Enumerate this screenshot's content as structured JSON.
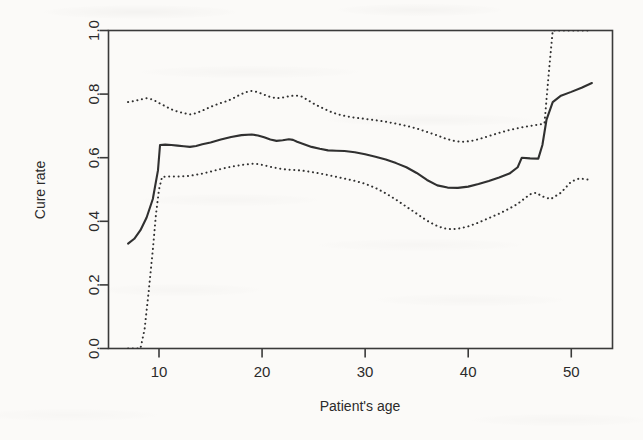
{
  "chart_data": {
    "type": "line",
    "title": "",
    "subtitle": "",
    "xlabel": "Patient's age",
    "ylabel": "Cure rate",
    "xlim": [
      5.1,
      54.0
    ],
    "ylim": [
      0.0,
      1.0
    ],
    "xticks": [
      10,
      20,
      30,
      40,
      50
    ],
    "xtick_labels": [
      "10",
      "20",
      "30",
      "40",
      "50"
    ],
    "yticks": [
      0.0,
      0.2,
      0.4,
      0.6,
      0.8,
      1.0
    ],
    "ytick_labels": [
      "0.0",
      "0.2",
      "0.4",
      "0.6",
      "0.8",
      "1.0"
    ],
    "grid": false,
    "legend": "none",
    "line_color": "#303030",
    "band_color": "#303030",
    "series": [
      {
        "name": "Upper confidence bound",
        "style": "dotted",
        "x": [
          7.0,
          7.6,
          8.2,
          8.8,
          9.4,
          10.0,
          10.6,
          11.2,
          11.8,
          12.4,
          13.0,
          13.6,
          14.2,
          14.8,
          15.4,
          16.0,
          16.6,
          17.2,
          17.8,
          18.4,
          19.0,
          19.6,
          20.2,
          20.8,
          21.4,
          22.0,
          22.6,
          23.2,
          23.8,
          24.4,
          25.0,
          25.8,
          26.6,
          27.4,
          28.2,
          29.0,
          30.0,
          31.0,
          32.0,
          33.0,
          34.0,
          35.0,
          36.0,
          37.0,
          37.8,
          38.6,
          39.4,
          40.2,
          41.0,
          42.0,
          43.0,
          44.0,
          45.0,
          46.0,
          47.0,
          47.4,
          47.8,
          48.2,
          49.0,
          50.0,
          51.0,
          52.0
        ],
        "y": [
          0.775,
          0.778,
          0.783,
          0.787,
          0.783,
          0.772,
          0.762,
          0.752,
          0.745,
          0.74,
          0.736,
          0.74,
          0.748,
          0.757,
          0.765,
          0.772,
          0.778,
          0.787,
          0.797,
          0.806,
          0.81,
          0.806,
          0.798,
          0.791,
          0.787,
          0.789,
          0.793,
          0.796,
          0.793,
          0.782,
          0.77,
          0.757,
          0.745,
          0.736,
          0.73,
          0.726,
          0.722,
          0.718,
          0.713,
          0.707,
          0.7,
          0.692,
          0.681,
          0.67,
          0.66,
          0.653,
          0.65,
          0.652,
          0.658,
          0.668,
          0.678,
          0.687,
          0.694,
          0.7,
          0.705,
          0.708,
          0.86,
          1.0,
          1.0,
          1.0,
          1.0,
          1.0
        ]
      },
      {
        "name": "Estimated cure rate",
        "style": "solid",
        "x": [
          7.0,
          7.6,
          8.2,
          8.8,
          9.4,
          9.9,
          10.1,
          10.6,
          11.2,
          11.8,
          12.4,
          13.0,
          13.6,
          14.2,
          15.0,
          16.0,
          17.0,
          18.0,
          19.0,
          19.6,
          20.2,
          20.8,
          21.4,
          22.0,
          22.6,
          23.0,
          23.4,
          24.0,
          24.8,
          25.6,
          26.4,
          27.2,
          28.0,
          29.0,
          30.0,
          31.0,
          32.0,
          33.0,
          34.0,
          35.0,
          36.0,
          37.0,
          38.0,
          39.0,
          40.0,
          41.0,
          42.0,
          43.0,
          44.0,
          44.8,
          45.2,
          46.0,
          46.8,
          47.2,
          47.6,
          48.2,
          49.0,
          50.0,
          51.0,
          52.0
        ],
        "y": [
          0.33,
          0.345,
          0.372,
          0.412,
          0.47,
          0.56,
          0.64,
          0.641,
          0.64,
          0.638,
          0.636,
          0.634,
          0.637,
          0.642,
          0.648,
          0.657,
          0.665,
          0.671,
          0.673,
          0.67,
          0.664,
          0.657,
          0.653,
          0.655,
          0.658,
          0.656,
          0.65,
          0.643,
          0.634,
          0.628,
          0.623,
          0.622,
          0.621,
          0.617,
          0.611,
          0.603,
          0.594,
          0.583,
          0.57,
          0.552,
          0.53,
          0.513,
          0.506,
          0.505,
          0.509,
          0.517,
          0.527,
          0.538,
          0.55,
          0.57,
          0.6,
          0.598,
          0.597,
          0.64,
          0.72,
          0.775,
          0.795,
          0.807,
          0.82,
          0.835
        ]
      },
      {
        "name": "Lower confidence bound",
        "style": "dotted",
        "x": [
          7.0,
          7.6,
          8.2,
          8.6,
          9.0,
          9.4,
          9.7,
          10.0,
          10.3,
          11.0,
          11.8,
          12.6,
          13.4,
          14.2,
          15.0,
          15.8,
          16.6,
          17.4,
          18.2,
          19.0,
          19.6,
          20.2,
          21.0,
          21.8,
          22.6,
          23.4,
          24.2,
          25.0,
          26.0,
          27.0,
          28.0,
          29.0,
          30.0,
          31.0,
          32.0,
          33.0,
          34.0,
          35.0,
          36.0,
          36.8,
          37.6,
          38.4,
          39.2,
          40.0,
          41.0,
          42.0,
          43.0,
          44.0,
          44.8,
          45.4,
          46.0,
          46.6,
          47.2,
          48.0,
          49.0,
          50.0,
          50.8,
          51.4,
          52.0
        ],
        "y": [
          0.0,
          0.0,
          0.0,
          0.06,
          0.18,
          0.31,
          0.42,
          0.5,
          0.54,
          0.541,
          0.541,
          0.542,
          0.545,
          0.55,
          0.556,
          0.563,
          0.569,
          0.574,
          0.578,
          0.581,
          0.58,
          0.576,
          0.57,
          0.565,
          0.562,
          0.561,
          0.558,
          0.554,
          0.548,
          0.541,
          0.534,
          0.527,
          0.518,
          0.505,
          0.488,
          0.468,
          0.446,
          0.424,
          0.402,
          0.388,
          0.378,
          0.375,
          0.378,
          0.384,
          0.396,
          0.41,
          0.424,
          0.44,
          0.455,
          0.47,
          0.485,
          0.49,
          0.478,
          0.47,
          0.49,
          0.525,
          0.535,
          0.532,
          0.53
        ]
      }
    ]
  }
}
